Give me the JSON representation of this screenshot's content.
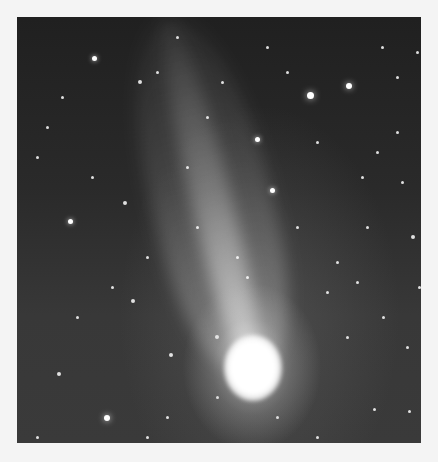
{
  "image": {
    "subject": "comet with long tail in star field",
    "frame": {
      "x": 17,
      "y": 17,
      "width": 404,
      "height": 426
    },
    "comet": {
      "head": {
        "x": 235,
        "y": 351
      },
      "tail_end": {
        "x": 150,
        "y": 0
      }
    },
    "stars": [
      [
        77,
        41,
        5
      ],
      [
        123,
        65,
        4
      ],
      [
        140,
        55,
        3
      ],
      [
        293,
        78,
        7
      ],
      [
        332,
        69,
        6
      ],
      [
        240,
        122,
        5
      ],
      [
        255,
        173,
        5
      ],
      [
        53,
        204,
        5
      ],
      [
        90,
        401,
        6
      ],
      [
        116,
        284,
        4
      ],
      [
        154,
        338,
        4
      ],
      [
        42,
        357,
        4
      ],
      [
        108,
        186,
        4
      ],
      [
        200,
        320,
        4
      ],
      [
        365,
        30,
        3
      ],
      [
        380,
        60,
        3
      ],
      [
        400,
        35,
        3
      ],
      [
        160,
        20,
        3
      ],
      [
        250,
        30,
        3
      ],
      [
        300,
        125,
        3
      ],
      [
        360,
        135,
        3
      ],
      [
        320,
        245,
        3
      ],
      [
        310,
        275,
        3
      ],
      [
        380,
        115,
        3
      ],
      [
        396,
        220,
        4
      ],
      [
        340,
        265,
        3
      ],
      [
        357,
        392,
        3
      ],
      [
        392,
        394,
        3
      ],
      [
        60,
        300,
        3
      ],
      [
        30,
        110,
        3
      ],
      [
        20,
        140,
        3
      ],
      [
        170,
        150,
        3
      ],
      [
        190,
        100,
        3
      ],
      [
        130,
        240,
        3
      ],
      [
        95,
        270,
        3
      ],
      [
        200,
        380,
        3
      ],
      [
        260,
        400,
        3
      ],
      [
        300,
        420,
        3
      ],
      [
        20,
        420,
        3
      ],
      [
        130,
        420,
        3
      ],
      [
        345,
        160,
        3
      ],
      [
        280,
        210,
        3
      ],
      [
        230,
        260,
        3
      ],
      [
        75,
        160,
        3
      ],
      [
        45,
        80,
        3
      ],
      [
        205,
        65,
        3
      ],
      [
        270,
        55,
        3
      ],
      [
        350,
        210,
        3
      ],
      [
        330,
        320,
        3
      ],
      [
        366,
        300,
        3
      ],
      [
        220,
        240,
        3
      ],
      [
        180,
        210,
        3
      ],
      [
        385,
        165,
        3
      ],
      [
        402,
        270,
        3
      ],
      [
        390,
        330,
        3
      ],
      [
        150,
        400,
        3
      ]
    ]
  }
}
